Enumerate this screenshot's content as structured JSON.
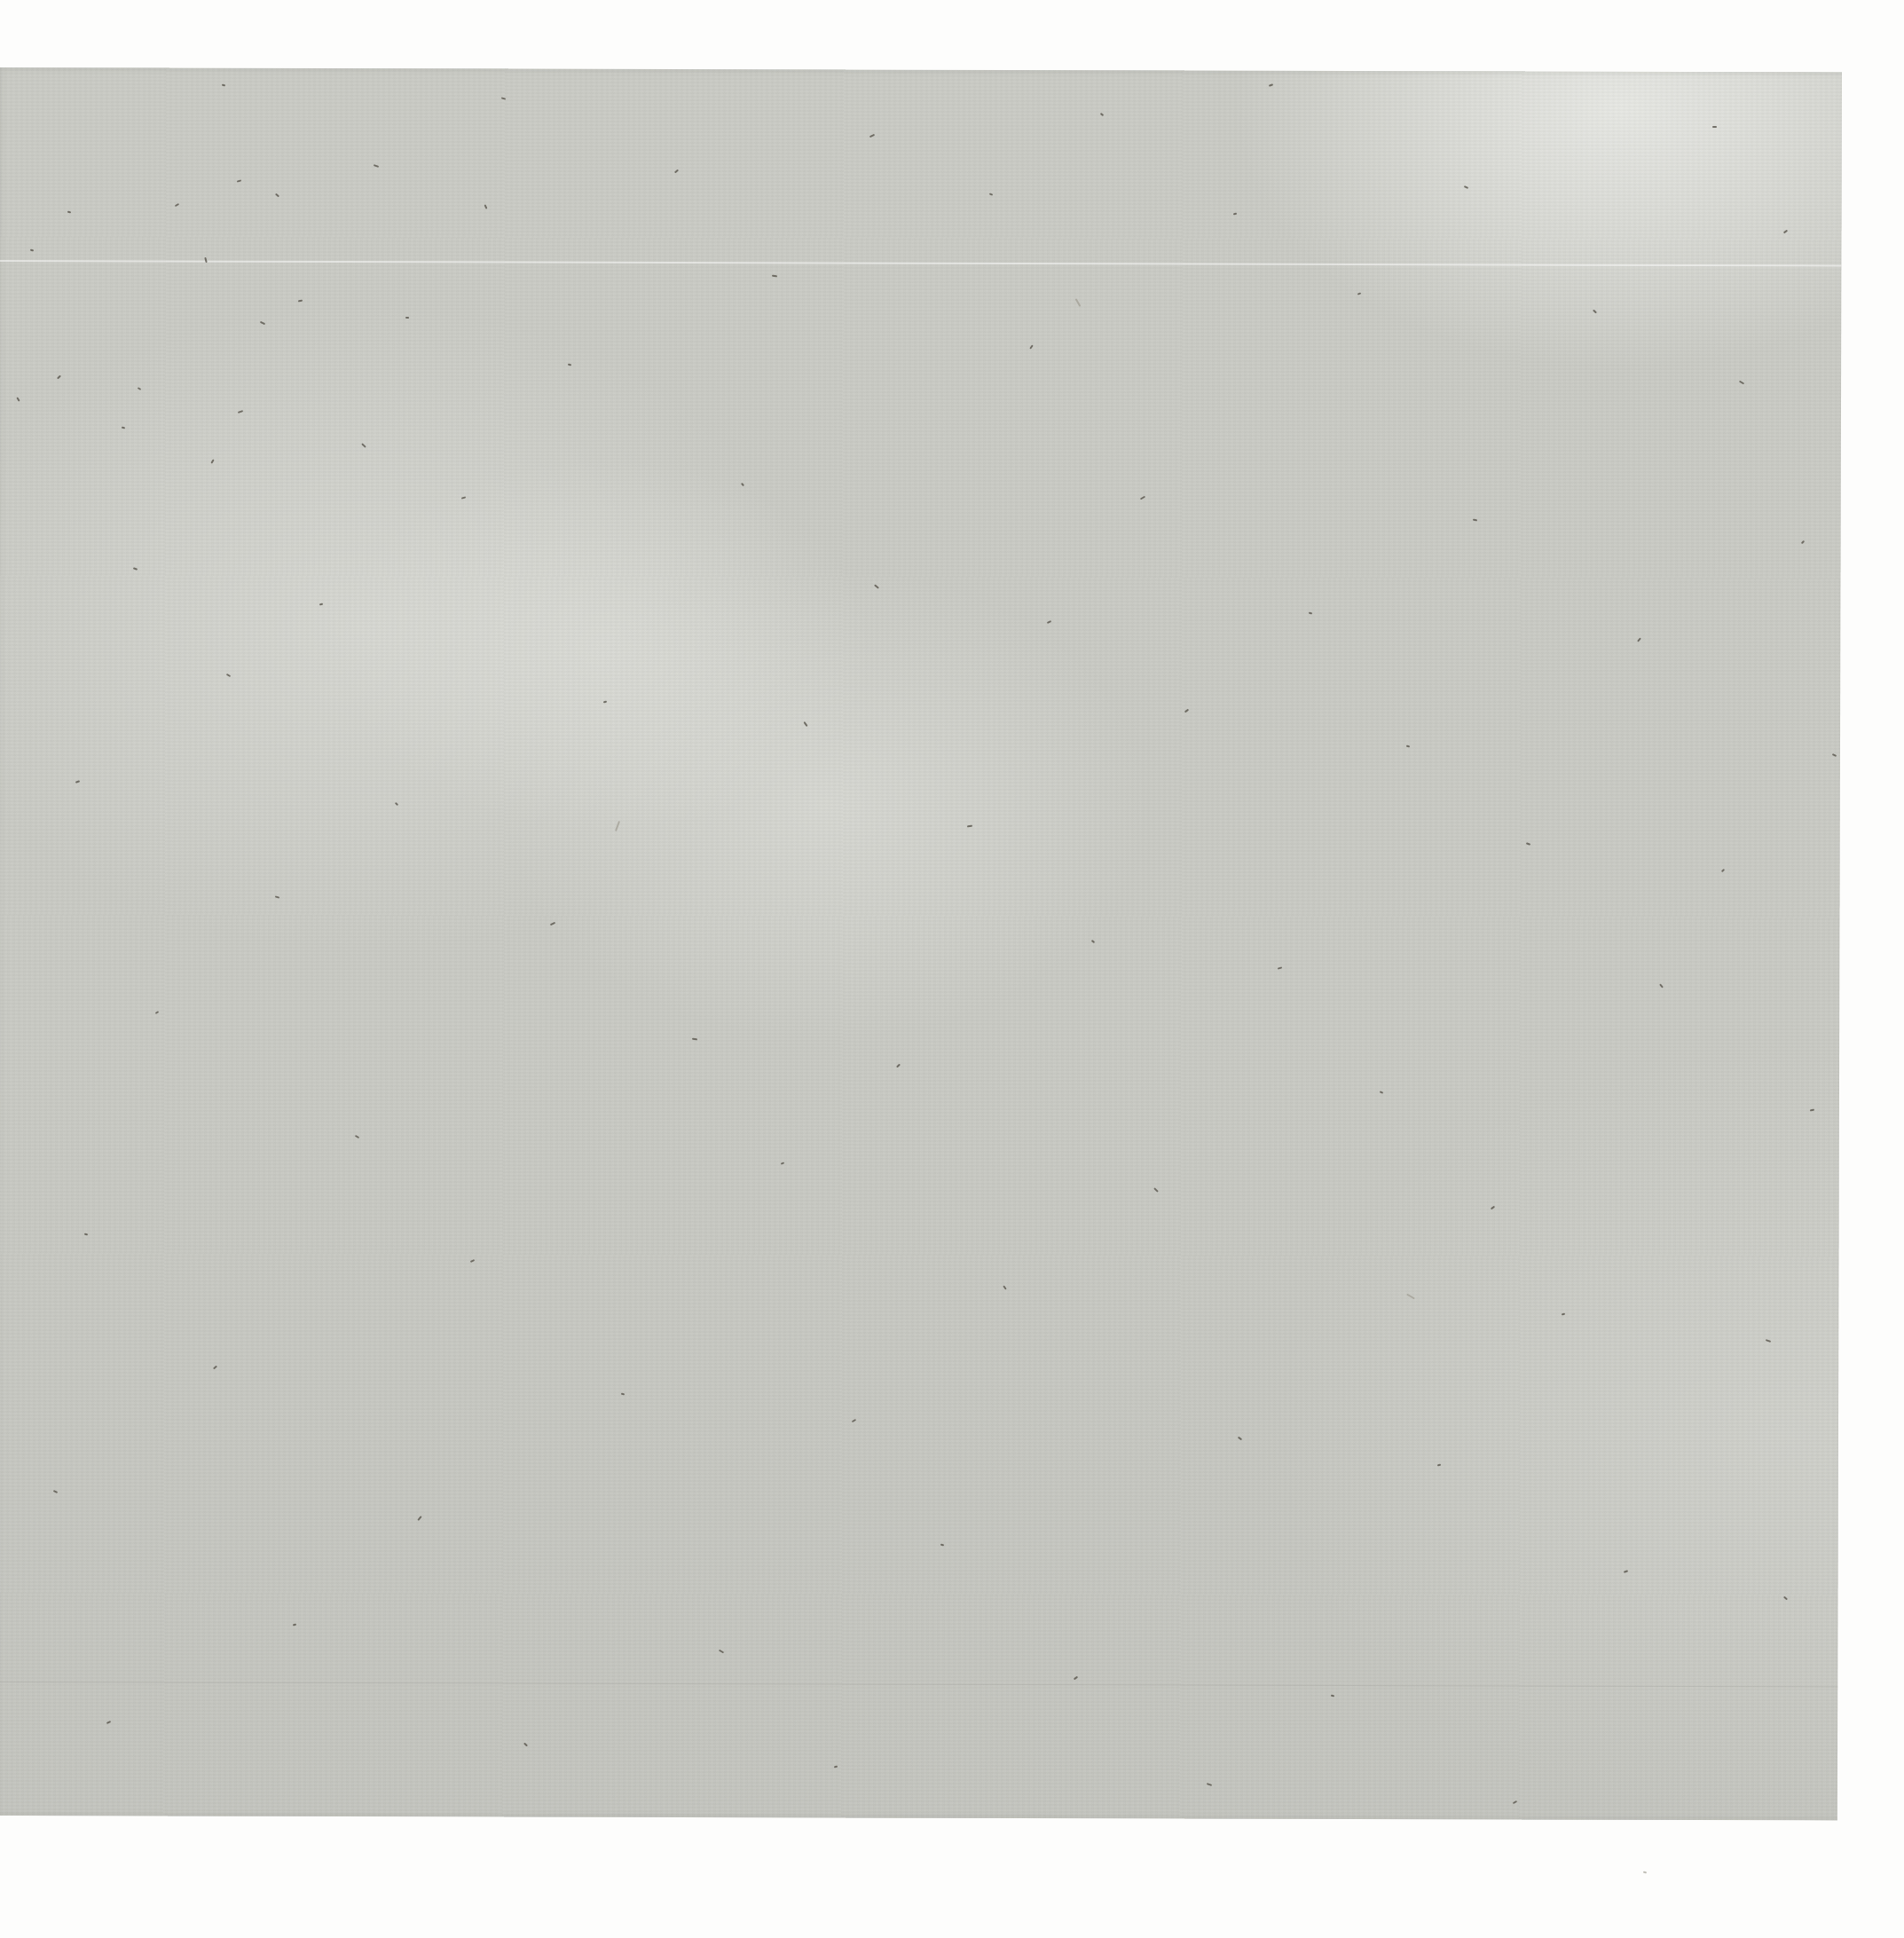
{
  "scene": {
    "description": "Photograph of a blank gray flecked paper sheet on a white background; no text or UI elements visible",
    "background_color": "#fdfdfc"
  },
  "sheet": {
    "left": -4,
    "top": 76,
    "width": 2080,
    "height": 1970,
    "rotation_deg": 0.15,
    "base_color": "#c8c9c3",
    "light_patch_color": "#dadbd6",
    "dark_edge_color": "#bfc0ba"
  },
  "artifact_lines": [
    {
      "y": 293,
      "thickness": 2,
      "color": "rgba(255,255,255,0.5)"
    },
    {
      "y": 1895,
      "thickness": 1,
      "color": "rgba(150,152,146,0.25)"
    }
  ],
  "specks": {
    "dark_color": "#57544b",
    "light_color": "#979488",
    "points": [
      [
        421,
        186,
        20,
        6,
        0
      ],
      [
        267,
        203,
        -15,
        5,
        0
      ],
      [
        310,
        219,
        40,
        5,
        0
      ],
      [
        76,
        238,
        10,
        4,
        0
      ],
      [
        197,
        230,
        -30,
        5,
        0
      ],
      [
        34,
        281,
        15,
        4,
        0
      ],
      [
        229,
        292,
        75,
        6,
        0
      ],
      [
        336,
        338,
        -10,
        5,
        0
      ],
      [
        293,
        363,
        25,
        6,
        0
      ],
      [
        457,
        357,
        5,
        4,
        0
      ],
      [
        64,
        424,
        -45,
        5,
        0
      ],
      [
        155,
        437,
        30,
        4,
        0
      ],
      [
        18,
        449,
        60,
        5,
        0
      ],
      [
        268,
        463,
        -20,
        6,
        0
      ],
      [
        137,
        481,
        10,
        4,
        0
      ],
      [
        407,
        501,
        45,
        6,
        0
      ],
      [
        237,
        519,
        -60,
        5,
        0
      ],
      [
        565,
        110,
        15,
        5,
        0
      ],
      [
        980,
        152,
        -25,
        6,
        0
      ],
      [
        1240,
        128,
        35,
        4,
        0
      ],
      [
        1930,
        142,
        0,
        5,
        0
      ],
      [
        760,
        192,
        -40,
        5,
        0
      ],
      [
        1115,
        218,
        20,
        4,
        0
      ],
      [
        545,
        232,
        65,
        5,
        0
      ],
      [
        1390,
        240,
        -10,
        4,
        0
      ],
      [
        1650,
        210,
        25,
        5,
        0
      ],
      [
        2010,
        260,
        -35,
        5,
        0
      ],
      [
        870,
        310,
        10,
        6,
        0
      ],
      [
        1530,
        330,
        -20,
        4,
        0
      ],
      [
        1795,
        350,
        45,
        5,
        0
      ],
      [
        1160,
        390,
        -55,
        5,
        0
      ],
      [
        640,
        410,
        15,
        4,
        0
      ],
      [
        1960,
        430,
        30,
        6,
        0
      ],
      [
        520,
        560,
        -15,
        5,
        0
      ],
      [
        835,
        545,
        50,
        4,
        0
      ],
      [
        1285,
        560,
        -30,
        6,
        0
      ],
      [
        1660,
        585,
        10,
        5,
        0
      ],
      [
        2030,
        610,
        -45,
        4,
        0
      ],
      [
        150,
        640,
        20,
        5,
        0
      ],
      [
        360,
        680,
        -10,
        4,
        0
      ],
      [
        985,
        660,
        40,
        6,
        0
      ],
      [
        1180,
        700,
        -25,
        5,
        0
      ],
      [
        1475,
        690,
        15,
        4,
        0
      ],
      [
        1845,
        720,
        -50,
        5,
        0
      ],
      [
        255,
        760,
        30,
        5,
        0
      ],
      [
        680,
        790,
        -15,
        4,
        0
      ],
      [
        905,
        815,
        55,
        6,
        0
      ],
      [
        1335,
        800,
        -35,
        5,
        0
      ],
      [
        1585,
        840,
        10,
        4,
        0
      ],
      [
        2065,
        850,
        25,
        5,
        0
      ],
      [
        85,
        880,
        -20,
        5,
        0
      ],
      [
        445,
        905,
        40,
        4,
        0
      ],
      [
        1090,
        930,
        -10,
        6,
        0
      ],
      [
        1720,
        950,
        20,
        5,
        0
      ],
      [
        1940,
        980,
        -40,
        4,
        0
      ],
      [
        310,
        1010,
        15,
        5,
        0
      ],
      [
        620,
        1040,
        -25,
        6,
        0
      ],
      [
        1230,
        1060,
        35,
        4,
        0
      ],
      [
        1440,
        1090,
        -15,
        5,
        0
      ],
      [
        1870,
        1110,
        50,
        5,
        0
      ],
      [
        175,
        1140,
        -30,
        4,
        0
      ],
      [
        780,
        1170,
        10,
        6,
        0
      ],
      [
        1010,
        1200,
        -45,
        5,
        0
      ],
      [
        1555,
        1230,
        25,
        4,
        0
      ],
      [
        2040,
        1250,
        -10,
        5,
        0
      ],
      [
        400,
        1280,
        30,
        5,
        0
      ],
      [
        880,
        1310,
        -20,
        4,
        0
      ],
      [
        1300,
        1340,
        45,
        6,
        0
      ],
      [
        1680,
        1360,
        -35,
        5,
        0
      ],
      [
        95,
        1390,
        15,
        4,
        0
      ],
      [
        530,
        1420,
        -25,
        5,
        0
      ],
      [
        1130,
        1450,
        55,
        5,
        0
      ],
      [
        1760,
        1480,
        -15,
        4,
        0
      ],
      [
        1990,
        1510,
        20,
        6,
        0
      ],
      [
        240,
        1540,
        -40,
        5,
        0
      ],
      [
        700,
        1570,
        10,
        4,
        0
      ],
      [
        960,
        1600,
        -30,
        5,
        0
      ],
      [
        1395,
        1620,
        35,
        5,
        0
      ],
      [
        1620,
        1650,
        -10,
        4,
        0
      ],
      [
        60,
        1680,
        25,
        5,
        0
      ],
      [
        470,
        1710,
        -50,
        6,
        0
      ],
      [
        1060,
        1740,
        15,
        4,
        0
      ],
      [
        1830,
        1770,
        -20,
        5,
        0
      ],
      [
        2010,
        1800,
        40,
        5,
        0
      ],
      [
        330,
        1830,
        -15,
        4,
        0
      ],
      [
        810,
        1860,
        30,
        6,
        0
      ],
      [
        1210,
        1890,
        -35,
        5,
        0
      ],
      [
        1500,
        1910,
        10,
        4,
        0
      ],
      [
        120,
        1940,
        -25,
        5,
        0
      ],
      [
        590,
        1965,
        45,
        5,
        0
      ],
      [
        940,
        1990,
        -10,
        4,
        0
      ],
      [
        1360,
        2010,
        20,
        6,
        0
      ],
      [
        1705,
        2030,
        -30,
        5,
        0
      ],
      [
        250,
        95,
        15,
        4,
        0
      ],
      [
        1430,
        95,
        -20,
        5,
        0
      ],
      [
        1210,
        340,
        60,
        10,
        1
      ],
      [
        690,
        930,
        -70,
        12,
        1
      ],
      [
        1585,
        1460,
        30,
        10,
        1
      ],
      [
        1852,
        2109,
        10,
        4,
        1
      ]
    ]
  }
}
